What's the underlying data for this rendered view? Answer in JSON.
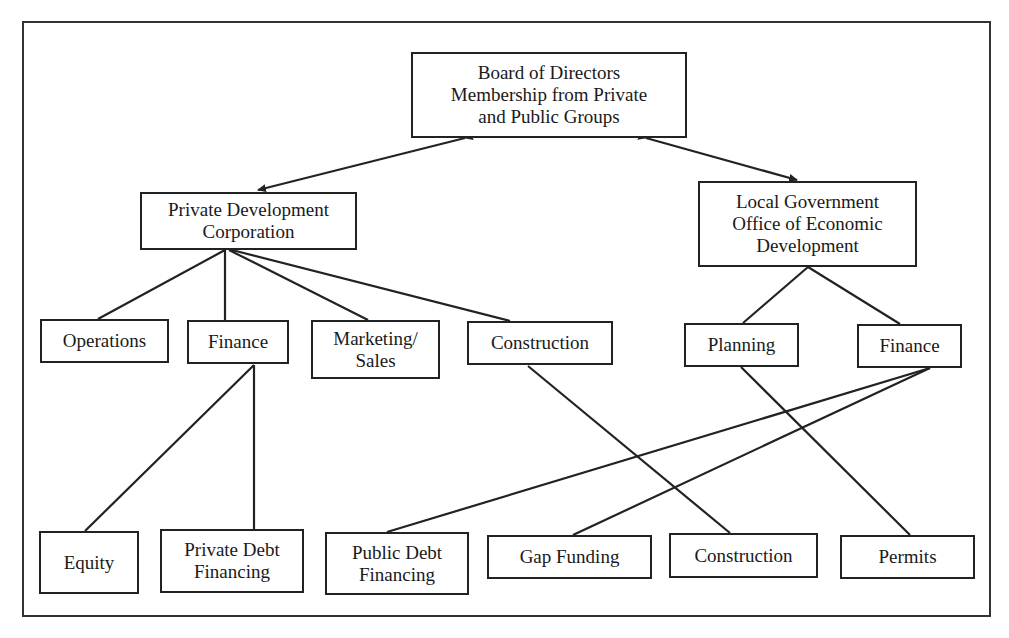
{
  "diagram": {
    "type": "organizational-chart",
    "nodes": {
      "board": {
        "label": "Board of Directors\nMembership from Private\nand Public Groups"
      },
      "pdc": {
        "label": "Private Development\nCorporation"
      },
      "localgov": {
        "label": "Local Government\nOffice of Economic\nDevelopment"
      },
      "operations": {
        "label": "Operations"
      },
      "finance_private": {
        "label": "Finance"
      },
      "marketing": {
        "label": "Marketing/\nSales"
      },
      "construction_private": {
        "label": "Construction"
      },
      "planning": {
        "label": "Planning"
      },
      "finance_public": {
        "label": "Finance"
      },
      "equity": {
        "label": "Equity"
      },
      "private_debt": {
        "label": "Private Debt\nFinancing"
      },
      "public_debt": {
        "label": "Public Debt\nFinancing"
      },
      "gap_funding": {
        "label": "Gap Funding"
      },
      "construction_bottom": {
        "label": "Construction"
      },
      "permits": {
        "label": "Permits"
      }
    },
    "edges": [
      {
        "from": "board",
        "to": "pdc",
        "style": "double-arrow"
      },
      {
        "from": "board",
        "to": "localgov",
        "style": "double-arrow"
      },
      {
        "from": "pdc",
        "to": "operations"
      },
      {
        "from": "pdc",
        "to": "finance_private"
      },
      {
        "from": "pdc",
        "to": "marketing"
      },
      {
        "from": "pdc",
        "to": "construction_private"
      },
      {
        "from": "localgov",
        "to": "planning"
      },
      {
        "from": "localgov",
        "to": "finance_public"
      },
      {
        "from": "finance_private",
        "to": "equity"
      },
      {
        "from": "finance_private",
        "to": "private_debt"
      },
      {
        "from": "construction_private",
        "to": "construction_bottom"
      },
      {
        "from": "planning",
        "to": "permits"
      },
      {
        "from": "finance_public",
        "to": "public_debt"
      },
      {
        "from": "finance_public",
        "to": "gap_funding"
      }
    ]
  }
}
